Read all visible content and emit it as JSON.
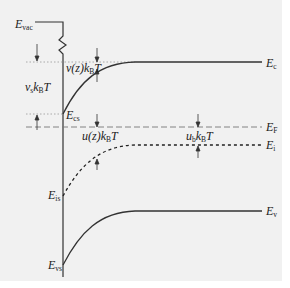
{
  "diagram": {
    "type": "semiconductor-band-bending",
    "colors": {
      "background": "#f1f1f1",
      "line": "#333333",
      "guide": "#999999"
    },
    "labels": {
      "vacuum": {
        "main": "E",
        "sub": "vac"
      },
      "conduction": {
        "main": "E",
        "sub": "c"
      },
      "conduction_surface": {
        "main": "E",
        "sub": "cs"
      },
      "fermi": {
        "main": "E",
        "sub": "F"
      },
      "intrinsic": {
        "main": "E",
        "sub": "i"
      },
      "intrinsic_surface": {
        "main": "E",
        "sub": "is"
      },
      "valence": {
        "main": "E",
        "sub": "v"
      },
      "valence_surface": {
        "main": "E",
        "sub": "vs"
      }
    },
    "annotations": {
      "vs": {
        "v": "v",
        "vsub": "s",
        "k": "k",
        "ksub": "B",
        "T": "T"
      },
      "vz": {
        "pre": "v(z)",
        "k": "k",
        "ksub": "B",
        "T": "T"
      },
      "uz": {
        "pre": "u(z)",
        "k": "k",
        "ksub": "B",
        "T": "T"
      },
      "ub": {
        "u": "u",
        "usub": "b",
        "k": "k",
        "ksub": "B",
        "T": "T"
      }
    }
  }
}
